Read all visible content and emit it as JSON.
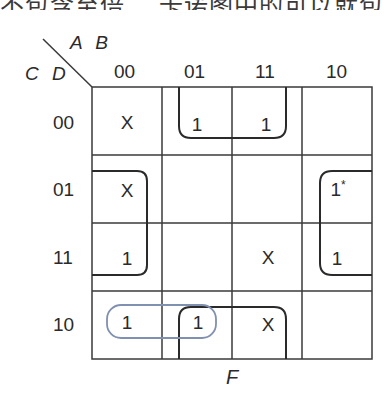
{
  "caption_cropped": "不包含至倍…  卡诺图中的可以就包",
  "axes": {
    "row_variables": "C D",
    "col_variables": "A B",
    "col_labels": [
      "00",
      "01",
      "11",
      "10"
    ],
    "row_labels": [
      "00",
      "01",
      "11",
      "10"
    ]
  },
  "function_label": "F",
  "cells": {
    "r00": [
      "X",
      "",
      "1",
      "1",
      ""
    ],
    "rows": [
      [
        "X",
        "1",
        "1",
        ""
      ],
      [
        "X",
        "",
        "",
        "1*"
      ],
      [
        "1",
        "",
        "X",
        "1"
      ],
      [
        "1",
        "1",
        "X",
        ""
      ]
    ]
  },
  "cell_star_note": "*",
  "loops": [
    {
      "name": "loop-top-middle",
      "cells": "row 00, cols 01-11 (wraps to row 10)",
      "color": "#2a2a2a"
    },
    {
      "name": "loop-bottom-middle",
      "cells": "row 10, cols 01-11 (wraps to row 00)",
      "color": "#2a2a2a"
    },
    {
      "name": "loop-left",
      "cells": "col 00, rows 01-11 (wraps to col 10)",
      "color": "#2a2a2a"
    },
    {
      "name": "loop-right",
      "cells": "col 10, rows 01-11 (wraps to col 00)",
      "color": "#2a2a2a"
    },
    {
      "name": "loop-blue",
      "cells": "row 10, cols 00-01",
      "color": "#8090b0"
    }
  ],
  "colors": {
    "grid": "#3a3a3a",
    "loop": "#2a2a2a",
    "blue_loop": "#8090b0"
  }
}
